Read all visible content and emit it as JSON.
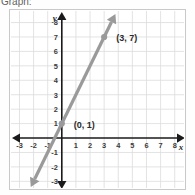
{
  "heading": {
    "text": "Graph:"
  },
  "chart_data": {
    "type": "line",
    "title": "",
    "xlabel": "x",
    "ylabel": "y",
    "xlim": [
      -3.6,
      8.8
    ],
    "ylim": [
      -3.6,
      8.8
    ],
    "grid": true,
    "legend": "none",
    "xticks": [
      -3,
      -2,
      -1,
      1,
      2,
      3,
      4,
      5,
      6,
      7,
      8
    ],
    "xtick_labels": [
      "-3",
      "-2",
      "-1",
      "1",
      "2",
      "3",
      "4",
      "5",
      "6",
      "7",
      "8"
    ],
    "yticks": [
      -3,
      -2,
      -1,
      1,
      2,
      3,
      4,
      5,
      6,
      7,
      8
    ],
    "ytick_labels": [
      "-3",
      "-2",
      "-1",
      "1",
      "2",
      "3",
      "4",
      "5",
      "6",
      "7",
      "8"
    ],
    "series": [
      {
        "name": "line",
        "kind": "line",
        "equation": "y = 2x + 1",
        "slope": 2,
        "intercept": 1,
        "color": "#9a9a9a",
        "arrow_both_ends": true,
        "x": [
          -2.2,
          3.8
        ],
        "y": [
          -3.4,
          8.6
        ]
      }
    ],
    "points": [
      {
        "label": "(0, 1)",
        "x": 0,
        "y": 1,
        "label_dx": 12,
        "label_dy": 4
      },
      {
        "label": "(3, 7)",
        "x": 3,
        "y": 7,
        "label_dx": 12,
        "label_dy": 4
      }
    ],
    "axis_colors": {
      "axis": "#1a1a1a",
      "grid": "#dcdcdc",
      "line": "#9a9a9a"
    }
  }
}
